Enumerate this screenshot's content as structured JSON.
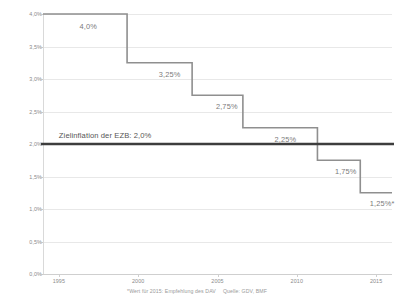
{
  "chart_data": {
    "type": "line",
    "subtype": "step",
    "title": "",
    "xlabel": "",
    "ylabel": "",
    "xlim": [
      1994,
      2016
    ],
    "ylim": [
      0.0,
      4.0
    ],
    "grid": true,
    "legend": "none",
    "x_ticks": [
      "1995",
      "2000",
      "2005",
      "2010",
      "2015"
    ],
    "x_tick_values": [
      1995,
      2000,
      2005,
      2010,
      2015
    ],
    "y_ticks": [
      "0,0%",
      "0,5%",
      "1,0%",
      "1,5%",
      "2,0%",
      "2,5%",
      "3,0%",
      "3,5%",
      "4,0%"
    ],
    "y_tick_values": [
      0.0,
      0.5,
      1.0,
      1.5,
      2.0,
      2.5,
      3.0,
      3.5,
      4.0
    ],
    "series": [
      {
        "name": "Hoechstrechnungszins",
        "color": "#8f8f8f",
        "steps": [
          {
            "x_start": 1994.0,
            "x_end": 1999.3,
            "value": 4.0,
            "label": "4,0%",
            "label_x": 1996.3,
            "label_y": 3.82
          },
          {
            "x_start": 1999.3,
            "x_end": 2003.4,
            "value": 3.25,
            "label": "3,25%",
            "label_x": 2001.3,
            "label_y": 3.07
          },
          {
            "x_start": 2003.4,
            "x_end": 2006.6,
            "value": 2.75,
            "label": "2,75%",
            "label_x": 2004.9,
            "label_y": 2.58
          },
          {
            "x_start": 2006.6,
            "x_end": 2011.3,
            "value": 2.25,
            "label": "2,25%",
            "label_x": 2008.6,
            "label_y": 2.08
          },
          {
            "x_start": 2011.3,
            "x_end": 2014.0,
            "value": 1.75,
            "label": "1,75%",
            "label_x": 2012.4,
            "label_y": 1.58
          },
          {
            "x_start": 2014.0,
            "x_end": 2016.0,
            "value": 1.25,
            "label": "1,25%*",
            "label_x": 2014.6,
            "label_y": 1.09
          }
        ]
      }
    ],
    "reference_line": {
      "name": "ecb-target-inflation",
      "value": 2.0,
      "color": "#3d3d3d",
      "label": "Zielinflation der EZB: 2,0%",
      "label_x": 1995.0,
      "label_y": 2.13
    },
    "footnote": {
      "note": "*Wert für 2015: Empfehlung des DAV",
      "source": "Quelle: GDV, BMF"
    }
  }
}
